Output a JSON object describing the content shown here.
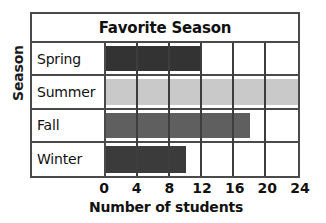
{
  "chart_data": {
    "type": "bar",
    "orientation": "horizontal",
    "title": "Favorite Season",
    "xlabel": "Number of students",
    "ylabel": "Season",
    "categories": [
      "Spring",
      "Summer",
      "Fall",
      "Winter"
    ],
    "values": [
      12,
      24,
      18,
      10
    ],
    "xlim": [
      0,
      24
    ],
    "xticks": [
      0,
      4,
      8,
      12,
      16,
      20,
      24
    ],
    "xtick_labels": [
      "0",
      "4",
      "8",
      "12",
      "16",
      "20",
      "24"
    ],
    "grid": true,
    "grid_axis": "x",
    "legend": false,
    "bar_colors": [
      "#333333",
      "#c9c9c9",
      "#5f5f5f",
      "#3b3b3b"
    ],
    "frame_color": "#4a4a4a",
    "background": "#ffffff"
  }
}
